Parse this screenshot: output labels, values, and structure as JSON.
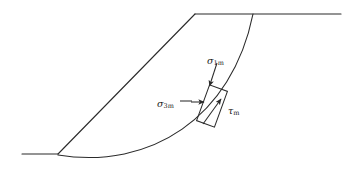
{
  "figure": {
    "title": "",
    "width": 357,
    "height": 175,
    "line_color": "#2b2b2b",
    "background_color": "#ffffff"
  },
  "labels": {
    "sigma1": {
      "symbol": "σ",
      "subscript": "1m",
      "name": "major-principal-stress"
    },
    "sigma3": {
      "symbol": "σ",
      "subscript": "3m",
      "name": "minor-principal-stress"
    },
    "tau": {
      "symbol": "τ",
      "subscript": "m",
      "name": "mobilized-shear-stress"
    }
  },
  "geometry": {
    "ground_left": {
      "x1": 22,
      "y1": 154,
      "x2": 58,
      "y2": 154
    },
    "slope_face": {
      "x1": 58,
      "y1": 154,
      "x2": 195,
      "y2": 14
    },
    "crest_top": {
      "x1": 195,
      "y1": 14,
      "x2": 341,
      "y2": 14
    },
    "failure_surface": {
      "start": {
        "x": 253,
        "y": 14
      },
      "end": {
        "x": 58,
        "y": 155
      },
      "control_1": {
        "x": 232,
        "y": 118
      },
      "control_2": {
        "x": 150,
        "y": 170
      }
    },
    "element_box": {
      "center": {
        "x": 212,
        "y": 106
      },
      "width": 19,
      "height": 38,
      "rotation_deg": 20
    },
    "arrow_sigma1": {
      "x1": 216,
      "y1": 63,
      "x2": 209,
      "y2": 87
    },
    "arrow_sigma3": {
      "x1": 180,
      "y1": 103,
      "x2": 203,
      "y2": 103
    },
    "arrow_tau": {
      "x1": 204,
      "y1": 123,
      "x2": 220,
      "y2": 100
    }
  }
}
